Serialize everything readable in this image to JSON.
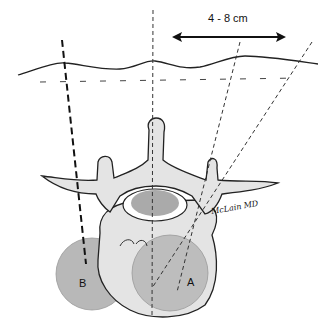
{
  "figure": {
    "distance_label": "4 - 8 cm",
    "circle_a_label": "A",
    "circle_b_label": "B",
    "signature": "McLain MD"
  },
  "colors": {
    "bone_fill": "#e6e6e6",
    "circle_fill": "#b0b0b0",
    "canal_fill": "#a8a8a8",
    "line": "#222222",
    "background": "#ffffff"
  }
}
